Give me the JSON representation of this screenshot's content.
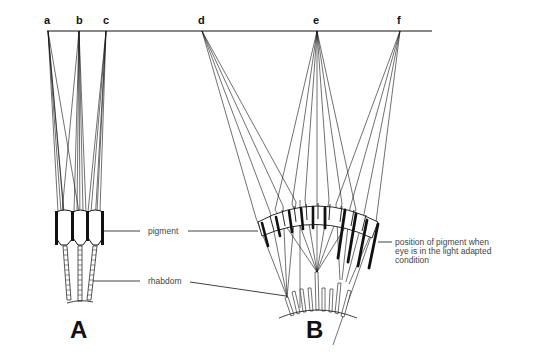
{
  "figure": {
    "object_plane_y": 31,
    "object_plane_x": [
      47,
      432
    ],
    "colors": {
      "ink": "#111111",
      "label": "#444444",
      "background": "#ffffff"
    }
  },
  "points": [
    {
      "id": "a",
      "label": "a",
      "x": 48
    },
    {
      "id": "b",
      "label": "b",
      "x": 79
    },
    {
      "id": "c",
      "label": "c",
      "x": 106
    },
    {
      "id": "d",
      "label": "d",
      "x": 202
    },
    {
      "id": "e",
      "label": "e",
      "x": 317
    },
    {
      "id": "f",
      "label": "f",
      "x": 400
    }
  ],
  "panels": [
    {
      "id": "A",
      "label": "A",
      "x": 70,
      "y": 338,
      "description": "apposition eye"
    },
    {
      "id": "B",
      "label": "B",
      "x": 307,
      "y": 338,
      "description": "superposition eye"
    }
  ],
  "callouts": {
    "pigment": "pigment",
    "rhabdom": "rhabdom",
    "light_adapted": [
      "position of pigment when",
      "eye is in the light adapted",
      "condition"
    ]
  }
}
